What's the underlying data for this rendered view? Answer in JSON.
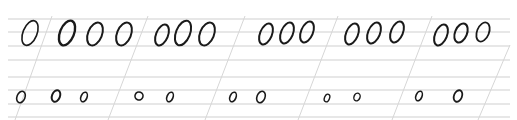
{
  "sheet": {
    "description": "Handwriting practice sheet with oval letter forms on ruled guidelines",
    "background": "#ffffff",
    "line_color": "#cfcfcf",
    "slant_color": "#d6d6d6",
    "ink_color": "#1a1a1a",
    "horizontal_lines_y": [
      19,
      32,
      46,
      60,
      77,
      90,
      104,
      117
    ],
    "slant_lines": [
      {
        "x_top": 52,
        "y_top": 16,
        "x_bottom": 15,
        "y_bottom": 120
      },
      {
        "x_top": 148,
        "y_top": 16,
        "x_bottom": 108,
        "y_bottom": 120
      },
      {
        "x_top": 245,
        "y_top": 16,
        "x_bottom": 205,
        "y_bottom": 120
      },
      {
        "x_top": 338,
        "y_top": 16,
        "x_bottom": 298,
        "y_bottom": 120
      },
      {
        "x_top": 432,
        "y_top": 16,
        "x_bottom": 392,
        "y_bottom": 120
      },
      {
        "x_top": 510,
        "y_top": 45,
        "x_bottom": 478,
        "y_bottom": 120
      }
    ],
    "rows": [
      {
        "name": "large-ovals",
        "ovals": [
          {
            "cx": 30,
            "cy": 33,
            "rx": 7,
            "ry": 13,
            "stroke": 1.6
          },
          {
            "cx": 67,
            "cy": 33,
            "rx": 7,
            "ry": 13,
            "stroke": 2.4
          },
          {
            "cx": 95,
            "cy": 34,
            "rx": 7,
            "ry": 12,
            "stroke": 2
          },
          {
            "cx": 124,
            "cy": 34,
            "rx": 7,
            "ry": 12,
            "stroke": 2
          },
          {
            "cx": 162,
            "cy": 35,
            "rx": 6,
            "ry": 11,
            "stroke": 2
          },
          {
            "cx": 183,
            "cy": 33,
            "rx": 7,
            "ry": 13,
            "stroke": 2
          },
          {
            "cx": 207,
            "cy": 34,
            "rx": 7,
            "ry": 12,
            "stroke": 2
          },
          {
            "cx": 266,
            "cy": 34,
            "rx": 6,
            "ry": 11,
            "stroke": 2
          },
          {
            "cx": 287,
            "cy": 33,
            "rx": 6,
            "ry": 11,
            "stroke": 2
          },
          {
            "cx": 307,
            "cy": 32,
            "rx": 6,
            "ry": 11,
            "stroke": 2
          },
          {
            "cx": 352,
            "cy": 34,
            "rx": 6,
            "ry": 11,
            "stroke": 2
          },
          {
            "cx": 374,
            "cy": 33,
            "rx": 6,
            "ry": 11,
            "stroke": 2
          },
          {
            "cx": 397,
            "cy": 32,
            "rx": 6,
            "ry": 11,
            "stroke": 2
          },
          {
            "cx": 441,
            "cy": 35,
            "rx": 6,
            "ry": 11,
            "stroke": 2
          },
          {
            "cx": 461,
            "cy": 33,
            "rx": 6,
            "ry": 10,
            "stroke": 2
          },
          {
            "cx": 483,
            "cy": 32,
            "rx": 6,
            "ry": 10,
            "stroke": 1.8
          }
        ]
      },
      {
        "name": "small-ovals",
        "ovals": [
          {
            "cx": 21,
            "cy": 97,
            "rx": 4,
            "ry": 6,
            "stroke": 1.6
          },
          {
            "cx": 56,
            "cy": 96,
            "rx": 4,
            "ry": 6,
            "stroke": 2
          },
          {
            "cx": 84,
            "cy": 97,
            "rx": 3,
            "ry": 5,
            "stroke": 1.6
          },
          {
            "cx": 139,
            "cy": 96,
            "rx": 4,
            "ry": 4,
            "stroke": 1.6
          },
          {
            "cx": 170,
            "cy": 97,
            "rx": 3,
            "ry": 5,
            "stroke": 1.6
          },
          {
            "cx": 233,
            "cy": 97,
            "rx": 3,
            "ry": 5,
            "stroke": 1.6
          },
          {
            "cx": 261,
            "cy": 97,
            "rx": 4,
            "ry": 6,
            "stroke": 1.6
          },
          {
            "cx": 327,
            "cy": 98,
            "rx": 2.5,
            "ry": 4,
            "stroke": 1.4
          },
          {
            "cx": 357,
            "cy": 97,
            "rx": 3,
            "ry": 4,
            "stroke": 1.4
          },
          {
            "cx": 419,
            "cy": 96,
            "rx": 3,
            "ry": 5,
            "stroke": 1.6
          },
          {
            "cx": 458,
            "cy": 96,
            "rx": 4,
            "ry": 6,
            "stroke": 1.8
          }
        ]
      }
    ]
  }
}
